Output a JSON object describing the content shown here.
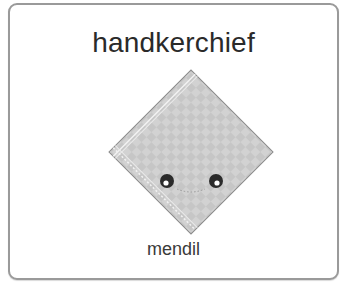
{
  "card": {
    "title": "handkerchief",
    "subtitle": "mendil",
    "image": {
      "icon": "handkerchief-icon",
      "fill": "#cfcfcf",
      "border": "#8a8a8a"
    }
  }
}
